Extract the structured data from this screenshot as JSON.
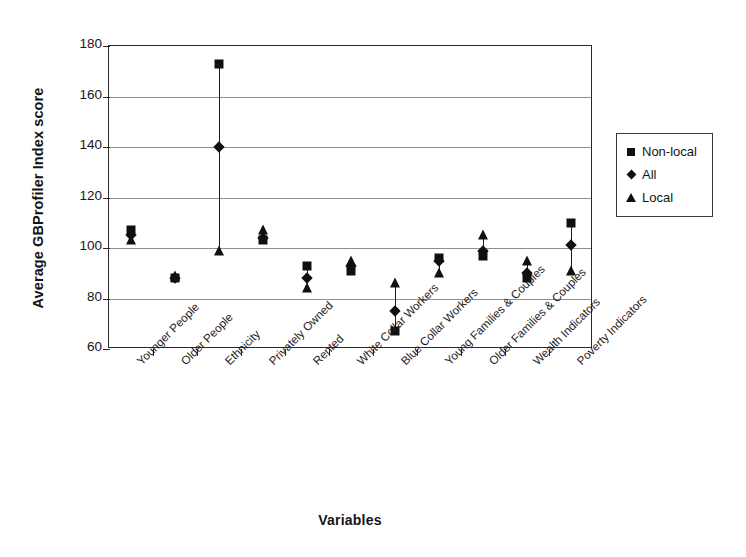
{
  "chart_data": {
    "type": "scatter",
    "title": "",
    "xlabel": "Variables",
    "ylabel": "Average GBProfiler Index score",
    "ylim": [
      60,
      180
    ],
    "yticks": [
      60,
      80,
      100,
      120,
      140,
      160,
      180
    ],
    "grid": "horizontal",
    "legend_position": "right",
    "categories": [
      "Younger People",
      "Older People",
      "Ethnicity",
      "Privately Owned",
      "Rented",
      "White Collar Workers",
      "Blue Collar Workers",
      "Young Families & Couples",
      "Older Families & Couples",
      "Wealth Indicators",
      "Poverty Indicators"
    ],
    "series": [
      {
        "name": "Non-local",
        "marker": "square",
        "values": [
          107,
          88,
          173,
          103,
          93,
          91,
          67,
          96,
          97,
          88,
          110
        ]
      },
      {
        "name": "All",
        "marker": "diamond",
        "values": [
          105,
          88,
          140,
          104,
          88,
          93,
          75,
          95,
          99,
          90,
          101
        ]
      },
      {
        "name": "Local",
        "marker": "triangle",
        "values": [
          103,
          89,
          99,
          107,
          84,
          95,
          86,
          90,
          105,
          95,
          91
        ]
      }
    ]
  },
  "legend": {
    "items": [
      {
        "label": "Non-local",
        "marker": "square-marker-icon"
      },
      {
        "label": "All",
        "marker": "diamond-marker-icon"
      },
      {
        "label": "Local",
        "marker": "triangle-marker-icon"
      }
    ]
  },
  "colors": {
    "marker": "#101010",
    "axis": "#2a2a2a",
    "grid": "#8e8e8e",
    "background": "#ffffff",
    "text": "#141414"
  }
}
